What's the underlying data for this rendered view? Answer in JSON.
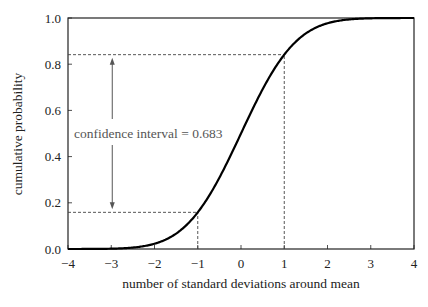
{
  "chart_data": {
    "type": "line",
    "title": "",
    "xlabel": "number of standard deviations around mean",
    "ylabel": "cumulative probability",
    "xlim": [
      -4,
      4
    ],
    "ylim": [
      0.0,
      1.0
    ],
    "xticks": [
      -4,
      -3,
      -2,
      -1,
      0,
      1,
      2,
      3,
      4
    ],
    "xtick_labels": [
      "−4",
      "−3",
      "−2",
      "−1",
      "0",
      "1",
      "2",
      "3",
      "4"
    ],
    "yticks": [
      0.0,
      0.2,
      0.4,
      0.6,
      0.8,
      1.0
    ],
    "ytick_labels": [
      "0.0",
      "0.2",
      "0.4",
      "0.6",
      "0.8",
      "1.0"
    ],
    "grid": false,
    "legend": null,
    "series": [
      {
        "name": "standard normal CDF",
        "x": [
          -4,
          -3.5,
          -3,
          -2.5,
          -2,
          -1.5,
          -1,
          -0.5,
          0,
          0.5,
          1,
          1.5,
          2,
          2.5,
          3,
          3.5,
          4
        ],
        "values": [
          0.0,
          0.0002,
          0.0013,
          0.0062,
          0.0228,
          0.0668,
          0.1587,
          0.3085,
          0.5,
          0.6915,
          0.8413,
          0.9332,
          0.9772,
          0.9938,
          0.9987,
          0.9998,
          1.0
        ]
      }
    ],
    "annotations": [
      {
        "type": "text",
        "text": "confidence interval = 0.683",
        "x": -3.6,
        "y": 0.57
      },
      {
        "type": "double-arrow",
        "x": -3.0,
        "y_from": 0.1587,
        "y_to": 0.8413
      },
      {
        "type": "dashed-hline",
        "y": 0.8413,
        "x_from": -4,
        "x_to": 1
      },
      {
        "type": "dashed-hline",
        "y": 0.1587,
        "x_from": -4,
        "x_to": -1
      },
      {
        "type": "dashed-vline",
        "x": 1,
        "y_from": 0,
        "y_to": 0.8413
      },
      {
        "type": "dashed-vline",
        "x": -1,
        "y_from": 0,
        "y_to": 0.1587
      }
    ]
  },
  "labels": {
    "annotation": "confidence interval = 0.683",
    "xlabel": "number of standard deviations around mean",
    "ylabel": "cumulative probability",
    "caption_fragment": "… standard deviation of the …"
  },
  "colors": {
    "curve": "#000000",
    "frame": "#222222",
    "dashed": "#444444",
    "annotation": "#555555"
  }
}
